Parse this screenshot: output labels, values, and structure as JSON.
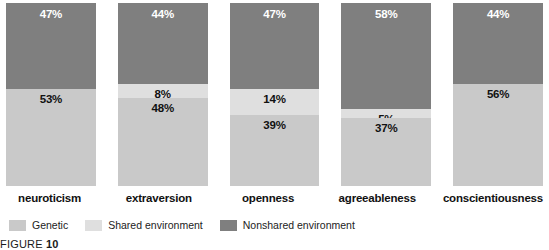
{
  "chart_data": {
    "type": "bar",
    "subtype": "stacked-100-percent",
    "title": "",
    "xlabel": "",
    "ylabel": "",
    "ylim": [
      0,
      100
    ],
    "grid": false,
    "legend_position": "bottom-left",
    "categories": [
      "neuroticism",
      "extraversion",
      "openness",
      "agreeableness",
      "conscientiousness"
    ],
    "series": [
      {
        "name": "Genetic",
        "color": "#c9c9c9",
        "values": [
          53,
          48,
          39,
          37,
          56
        ],
        "labels": [
          "53%",
          "48%",
          "39%",
          "37%",
          "56%"
        ]
      },
      {
        "name": "Shared environment",
        "color": "#dfdfdf",
        "values": [
          0,
          8,
          14,
          5,
          0
        ],
        "labels": [
          "",
          "8%",
          "14%",
          "5%",
          ""
        ]
      },
      {
        "name": "Nonshared environment",
        "color": "#7f7f7f",
        "values": [
          47,
          44,
          47,
          58,
          44
        ],
        "labels": [
          "47%",
          "44%",
          "47%",
          "58%",
          "44%"
        ]
      }
    ]
  },
  "columns": [
    {
      "category": "neuroticism",
      "segments": [
        {
          "series": "Nonshared environment",
          "value": 47,
          "label": "47%",
          "style": "seg-nonshared"
        },
        {
          "series": "Shared environment",
          "value": 0,
          "label": "",
          "style": "seg-shared"
        },
        {
          "series": "Genetic",
          "value": 53,
          "label": "53%",
          "style": "seg-genetic"
        }
      ]
    },
    {
      "category": "extraversion",
      "segments": [
        {
          "series": "Nonshared environment",
          "value": 44,
          "label": "44%",
          "style": "seg-nonshared"
        },
        {
          "series": "Shared environment",
          "value": 8,
          "label": "8%",
          "style": "seg-shared"
        },
        {
          "series": "Genetic",
          "value": 48,
          "label": "48%",
          "style": "seg-genetic"
        }
      ]
    },
    {
      "category": "openness",
      "segments": [
        {
          "series": "Nonshared environment",
          "value": 47,
          "label": "47%",
          "style": "seg-nonshared"
        },
        {
          "series": "Shared environment",
          "value": 14,
          "label": "14%",
          "style": "seg-shared"
        },
        {
          "series": "Genetic",
          "value": 39,
          "label": "39%",
          "style": "seg-genetic"
        }
      ]
    },
    {
      "category": "agreeableness",
      "segments": [
        {
          "series": "Nonshared environment",
          "value": 58,
          "label": "58%",
          "style": "seg-nonshared"
        },
        {
          "series": "Shared environment",
          "value": 5,
          "label": "5%",
          "style": "seg-shared"
        },
        {
          "series": "Genetic",
          "value": 37,
          "label": "37%",
          "style": "seg-genetic"
        }
      ]
    },
    {
      "category": "conscientiousness",
      "segments": [
        {
          "series": "Nonshared environment",
          "value": 44,
          "label": "44%",
          "style": "seg-nonshared"
        },
        {
          "series": "Shared environment",
          "value": 0,
          "label": "",
          "style": "seg-shared"
        },
        {
          "series": "Genetic",
          "value": 56,
          "label": "56%",
          "style": "seg-genetic"
        }
      ]
    }
  ],
  "legend": {
    "items": [
      {
        "label": "Genetic",
        "color": "#c9c9c9"
      },
      {
        "label": "Shared environment",
        "color": "#dfdfdf"
      },
      {
        "label": "Nonshared environment",
        "color": "#7f7f7f"
      }
    ]
  },
  "caption": {
    "prefix": "FIGURE",
    "number": "10"
  }
}
